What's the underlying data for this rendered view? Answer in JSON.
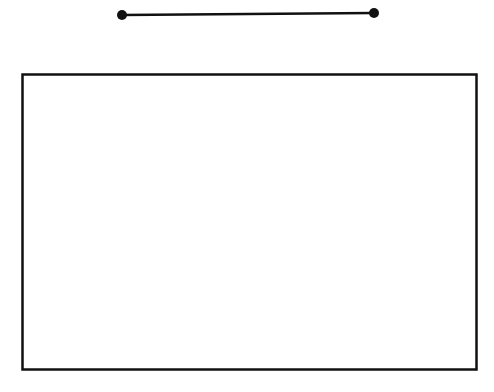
{
  "diagram": {
    "segment": {
      "x1": 122,
      "y1": 15,
      "x2": 374,
      "y2": 13,
      "color": "#111111"
    },
    "rectangle": {
      "x": 22,
      "y": 74,
      "width": 454,
      "height": 296,
      "stroke": "#111111",
      "fill": "#ffffff"
    }
  }
}
